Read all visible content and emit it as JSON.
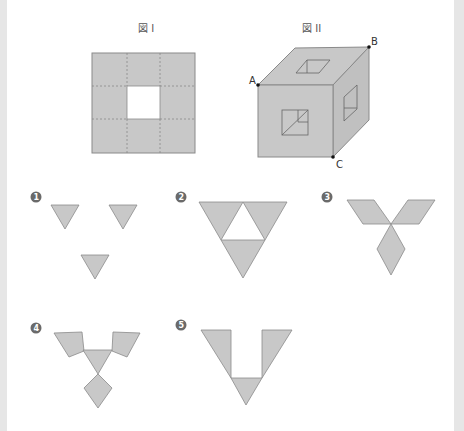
{
  "figure1": {
    "title": "図 I"
  },
  "figure2": {
    "title": "図 II",
    "points": {
      "A": "A",
      "B": "B",
      "C": "C"
    }
  },
  "options": [
    {
      "label": "1",
      "shape": "three separate small inverted triangles"
    },
    {
      "label": "2",
      "shape": "large inverted triangle with central triangular hole"
    },
    {
      "label": "3",
      "shape": "three rhombuses meeting at a point"
    },
    {
      "label": "4",
      "shape": "central inverted triangle with two quadrilaterals and a kite"
    },
    {
      "label": "5",
      "shape": "V shape of two triangles and a bottom triangle"
    }
  ],
  "colors": {
    "fill": "#c8c8c8",
    "stroke": "#8a8a8a",
    "badge": "#6a6a6a",
    "dashed": "#888888"
  }
}
